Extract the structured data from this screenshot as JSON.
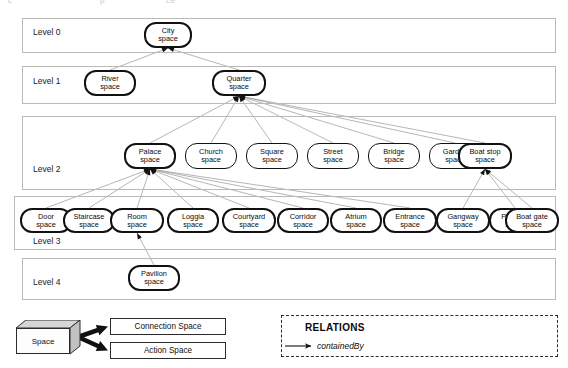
{
  "figure": {
    "type": "hierarchy-diagram",
    "ghost_header_fragments": [
      "c",
      "p",
      "ce"
    ],
    "levels": [
      {
        "id": "level0",
        "label": "Level 0",
        "band": {
          "x": 22,
          "y": 18,
          "w": 534,
          "h": 35
        },
        "label_pos": {
          "x": 33,
          "y": 32
        }
      },
      {
        "id": "level1",
        "label": "Level 1",
        "band": {
          "x": 22,
          "y": 66,
          "w": 534,
          "h": 38
        },
        "label_pos": {
          "x": 33,
          "y": 81
        }
      },
      {
        "id": "level2",
        "label": "Level 2",
        "band": {
          "x": 22,
          "y": 116,
          "w": 534,
          "h": 74
        },
        "label_pos": {
          "x": 33,
          "y": 169
        }
      },
      {
        "id": "level3",
        "label": "Level 3",
        "band": {
          "x": 14,
          "y": 196,
          "w": 542,
          "h": 54
        },
        "label_pos": {
          "x": 33,
          "y": 241
        }
      },
      {
        "id": "level4",
        "label": "Level 4",
        "band": {
          "x": 22,
          "y": 258,
          "w": 534,
          "h": 42
        },
        "label_pos": {
          "x": 33,
          "y": 282
        }
      }
    ],
    "nodes": [
      {
        "id": "city",
        "line1": "City",
        "line2": "space",
        "level": 0,
        "x": 144,
        "y": 22,
        "w": 48,
        "h": 26,
        "bold": true
      },
      {
        "id": "river",
        "line1": "River",
        "line2": "space",
        "level": 1,
        "x": 84,
        "y": 70,
        "w": 52,
        "h": 26,
        "bold": true
      },
      {
        "id": "quarter",
        "line1": "Quarter",
        "line2": "space",
        "level": 1,
        "x": 212,
        "y": 70,
        "w": 54,
        "h": 26,
        "bold": true
      },
      {
        "id": "palace",
        "line1": "Palace",
        "line2": "space",
        "level": 2,
        "x": 124,
        "y": 143,
        "w": 52,
        "h": 26,
        "bold": true
      },
      {
        "id": "church",
        "line1": "Church",
        "line2": "space",
        "level": 2,
        "x": 185,
        "y": 143,
        "w": 52,
        "h": 26,
        "bold": false
      },
      {
        "id": "square",
        "line1": "Square",
        "line2": "space",
        "level": 2,
        "x": 246,
        "y": 143,
        "w": 52,
        "h": 26,
        "bold": false
      },
      {
        "id": "street",
        "line1": "Street",
        "line2": "space",
        "level": 2,
        "x": 307,
        "y": 143,
        "w": 52,
        "h": 26,
        "bold": false
      },
      {
        "id": "bridge",
        "line1": "Bridge",
        "line2": "space",
        "level": 2,
        "x": 368,
        "y": 143,
        "w": 52,
        "h": 26,
        "bold": false
      },
      {
        "id": "garden",
        "line1": "Garden",
        "line2": "space",
        "level": 2,
        "x": 429,
        "y": 143,
        "w": 52,
        "h": 26,
        "bold": false
      },
      {
        "id": "boatstop",
        "line1": "Boat stop",
        "line2": "space",
        "level": 2,
        "x": 458,
        "y": 143,
        "w": 54,
        "h": 26,
        "bold": true
      },
      {
        "id": "door",
        "line1": "Door",
        "line2": "space",
        "level": 3,
        "x": 20,
        "y": 208,
        "w": 52,
        "h": 25,
        "bold": true
      },
      {
        "id": "staircase",
        "line1": "Staircase",
        "line2": "space",
        "level": 3,
        "x": 63,
        "y": 208,
        "w": 52,
        "h": 25,
        "bold": true
      },
      {
        "id": "room",
        "line1": "Room",
        "line2": "space",
        "level": 3,
        "x": 110,
        "y": 208,
        "w": 54,
        "h": 25,
        "bold": true
      },
      {
        "id": "loggia",
        "line1": "Loggia",
        "line2": "space",
        "level": 3,
        "x": 167,
        "y": 208,
        "w": 52,
        "h": 25,
        "bold": true
      },
      {
        "id": "courtyard",
        "line1": "Courtyard",
        "line2": "space",
        "level": 3,
        "x": 222,
        "y": 208,
        "w": 54,
        "h": 25,
        "bold": true
      },
      {
        "id": "corridor",
        "line1": "Corridor",
        "line2": "space",
        "level": 3,
        "x": 277,
        "y": 208,
        "w": 52,
        "h": 25,
        "bold": true
      },
      {
        "id": "atrium",
        "line1": "Atrium",
        "line2": "space",
        "level": 3,
        "x": 330,
        "y": 208,
        "w": 52,
        "h": 25,
        "bold": true
      },
      {
        "id": "entrance",
        "line1": "Entrance",
        "line2": "space",
        "level": 3,
        "x": 383,
        "y": 208,
        "w": 54,
        "h": 25,
        "bold": true
      },
      {
        "id": "gangway",
        "line1": "Gangway",
        "line2": "space",
        "level": 3,
        "x": 436,
        "y": 208,
        "w": 54,
        "h": 25,
        "bold": true
      },
      {
        "id": "platform",
        "line1": "Platform",
        "line2": "space",
        "level": 3,
        "x": 489,
        "y": 208,
        "w": 52,
        "h": 25,
        "bold": true
      },
      {
        "id": "boatgate",
        "line1": "Boat gate",
        "line2": "space",
        "level": 3,
        "x": 505,
        "y": 208,
        "w": 54,
        "h": 25,
        "bold": true
      },
      {
        "id": "pavilion",
        "line1": "Pavilion",
        "line2": "space",
        "level": 4,
        "x": 128,
        "y": 265,
        "w": 52,
        "h": 26,
        "bold": true
      }
    ],
    "edges": [
      {
        "from": "river",
        "to": "city"
      },
      {
        "from": "quarter",
        "to": "city"
      },
      {
        "from": "palace",
        "to": "quarter"
      },
      {
        "from": "church",
        "to": "quarter"
      },
      {
        "from": "square",
        "to": "quarter"
      },
      {
        "from": "street",
        "to": "quarter"
      },
      {
        "from": "bridge",
        "to": "quarter"
      },
      {
        "from": "garden",
        "to": "quarter"
      },
      {
        "from": "boatstop",
        "to": "quarter"
      },
      {
        "from": "door",
        "to": "palace"
      },
      {
        "from": "staircase",
        "to": "palace"
      },
      {
        "from": "room",
        "to": "palace"
      },
      {
        "from": "loggia",
        "to": "palace"
      },
      {
        "from": "courtyard",
        "to": "palace"
      },
      {
        "from": "corridor",
        "to": "palace"
      },
      {
        "from": "atrium",
        "to": "palace"
      },
      {
        "from": "entrance",
        "to": "palace"
      },
      {
        "from": "gangway",
        "to": "boatstop"
      },
      {
        "from": "platform",
        "to": "boatstop"
      },
      {
        "from": "boatgate",
        "to": "boatstop"
      },
      {
        "from": "pavilion",
        "to": "room"
      }
    ],
    "class_legend": {
      "source_label": "Space",
      "source_box": {
        "x": 16,
        "y": 320,
        "w": 64,
        "h": 36
      },
      "targets": [
        {
          "id": "connection-space",
          "label": "Connection Space",
          "x": 110,
          "y": 318,
          "w": 116,
          "h": 17
        },
        {
          "id": "action-space",
          "label": "Action Space",
          "x": 110,
          "y": 342,
          "w": 116,
          "h": 17
        }
      ]
    },
    "relations_legend": {
      "box": {
        "x": 281,
        "y": 315,
        "w": 277,
        "h": 42
      },
      "title": "RELATIONS",
      "items": [
        {
          "id": "containedby",
          "label": "containedBy"
        }
      ]
    },
    "colors": {
      "ink": "#111111",
      "band_border": "#b9b9b9",
      "edge": "#8a8a8a",
      "box_face": "#d8d8d8"
    }
  }
}
